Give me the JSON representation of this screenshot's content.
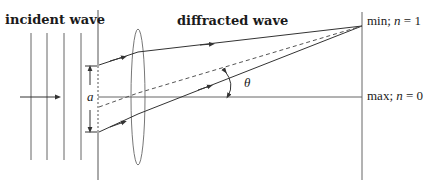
{
  "labels": {
    "incident": "incident wave",
    "diffracted": "diffracted wave",
    "slit_width": "a",
    "angle": "θ",
    "min_prefix": "min; ",
    "min_var": "n",
    "min_suffix": " = 1",
    "max_prefix": "max; ",
    "max_var": "n",
    "max_suffix": " = 0"
  },
  "colors": {
    "line": "#555555",
    "text": "#1a1a1a"
  }
}
